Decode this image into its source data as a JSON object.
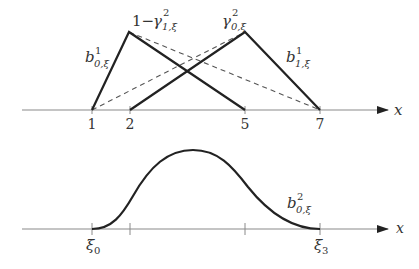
{
  "top_plot": {
    "axis_label": "x",
    "ticks": [
      "1",
      "2",
      "5",
      "7"
    ],
    "labels": {
      "left_line": {
        "base": "b",
        "sup": "1",
        "sub": "0,ξ"
      },
      "left_peak": {
        "prefix": "1−",
        "base": "γ",
        "sup": "2",
        "sub": "1,ξ"
      },
      "right_peak": {
        "base": "γ",
        "sup": "2",
        "sub": "0,ξ"
      },
      "right_line": {
        "base": "b",
        "sup": "1",
        "sub": "1,ξ"
      }
    }
  },
  "bottom_plot": {
    "axis_label": "x",
    "tick_labels": {
      "start": {
        "base": "ξ",
        "sub": "0"
      },
      "end": {
        "base": "ξ",
        "sub": "3"
      }
    },
    "curve_label": {
      "base": "b",
      "sup": "2",
      "sub": "0,ξ"
    }
  }
}
